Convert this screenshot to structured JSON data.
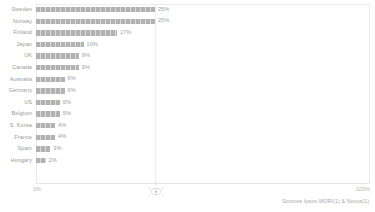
{
  "chart_data": {
    "type": "bar",
    "orientation": "horizontal",
    "title": "",
    "xlabel": "",
    "ylabel": "",
    "xlim": [
      0,
      100
    ],
    "grid": false,
    "legend": null,
    "axis_ticks": [
      "0%",
      "100%"
    ],
    "categories": [
      "Sweden",
      "Norway",
      "Finland",
      "Japan",
      "UK",
      "Canada",
      "Australia",
      "Germany",
      "US",
      "Belgium",
      "S. Korea",
      "France",
      "Spain",
      "Hungary"
    ],
    "values": [
      25,
      25,
      17,
      10,
      9,
      9,
      6,
      6,
      5,
      5,
      4,
      4,
      3,
      2
    ],
    "value_labels": [
      "25%",
      "25%",
      "17%",
      "10%",
      "9%",
      "9%",
      "6%",
      "6%",
      "5%",
      "5%",
      "4%",
      "4%",
      "3%",
      "2%"
    ],
    "bar_color": "#b2b2b2",
    "max_value": 25
  },
  "axis": {
    "left_tick": "0%",
    "right_tick": "100%"
  },
  "footer": {
    "sources": "Sources Ipsos-MORI(1) & Novus(1)"
  },
  "colors": {
    "bar": "#b2b2b2",
    "text": "#9a9a9a",
    "axis": "#ececec",
    "background": "#ffffff"
  }
}
